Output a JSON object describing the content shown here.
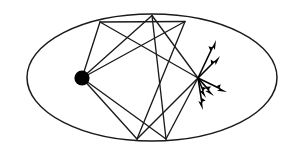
{
  "figure": {
    "title": "Elliptical billiard ray trajectory diagram",
    "caption": "",
    "background_color": "#ffffff",
    "stroke_color": "#1a1a1a",
    "node_color": "#000000",
    "arrow_color": "#000000",
    "width": 294,
    "height": 150
  },
  "chart_data": {
    "type": "scatter",
    "title": "",
    "xlabel": "",
    "ylabel": "",
    "grid": false,
    "legend_position": "none",
    "xlim": [
      0,
      294
    ],
    "ylim": [
      0,
      150
    ],
    "boundary": {
      "shape": "ellipse",
      "center": [
        152,
        77.5
      ],
      "radius_x": 125,
      "radius_y": 63.5,
      "stroke_width": 1.5
    },
    "nodes": [
      {
        "name": "source-point",
        "label": "",
        "x": 82,
        "y": 78,
        "radius": 7.6,
        "filled": true
      },
      {
        "name": "convergence-point",
        "label": "",
        "x": 198,
        "y": 78,
        "radius": 0,
        "filled": false
      }
    ],
    "reflection_points": [
      {
        "name": "vertex-top-left",
        "x": 100,
        "y": 22
      },
      {
        "name": "vertex-top-mid",
        "x": 152,
        "y": 15.5
      },
      {
        "name": "vertex-top-right",
        "x": 185,
        "y": 21.5
      },
      {
        "name": "vertex-bottom-left",
        "x": 137,
        "y": 139
      },
      {
        "name": "vertex-bottom-right",
        "x": 166,
        "y": 139
      }
    ],
    "ray_segments": [
      {
        "name": "ray-source-to-top-left",
        "from": [
          82,
          78
        ],
        "to": [
          100,
          22
        ]
      },
      {
        "name": "ray-top-left-to-top-right",
        "from": [
          100,
          22
        ],
        "to": [
          185,
          21.5
        ]
      },
      {
        "name": "ray-source-to-top-mid",
        "from": [
          82,
          78
        ],
        "to": [
          152,
          15.5
        ]
      },
      {
        "name": "ray-top-mid-to-convergence",
        "from": [
          152,
          15.5
        ],
        "to": [
          198,
          78
        ]
      },
      {
        "name": "ray-source-to-top-right-upper",
        "from": [
          82,
          78
        ],
        "to": [
          185,
          21.5
        ]
      },
      {
        "name": "ray-top-right-to-bottom-left",
        "from": [
          185,
          21.5
        ],
        "to": [
          137,
          139
        ]
      },
      {
        "name": "ray-convergence-to-top-left",
        "from": [
          198,
          78
        ],
        "to": [
          100,
          22
        ]
      },
      {
        "name": "ray-source-to-bottom-left",
        "from": [
          82,
          78
        ],
        "to": [
          137,
          139
        ]
      },
      {
        "name": "ray-source-to-bottom-right",
        "from": [
          82,
          78
        ],
        "to": [
          166,
          139
        ]
      },
      {
        "name": "ray-bottom-right-to-top-mid",
        "from": [
          166,
          139
        ],
        "to": [
          152,
          15.5
        ]
      },
      {
        "name": "ray-bottom-left-to-convergence",
        "from": [
          137,
          139
        ],
        "to": [
          198,
          78
        ]
      },
      {
        "name": "ray-bottom-right-to-convergence",
        "from": [
          166,
          139
        ],
        "to": [
          198,
          78
        ]
      }
    ],
    "arrows": {
      "origin": [
        198,
        78
      ],
      "count": 6,
      "vectors": [
        {
          "name": "arrow-up-steep",
          "to": [
            216,
            40
          ],
          "angle_deg": 64.7,
          "length": 42
        },
        {
          "name": "arrow-up-shallow",
          "to": [
            220,
            56
          ],
          "angle_deg": 45.0,
          "length": 31
        },
        {
          "name": "arrow-right-down-shallow",
          "to": [
            227,
            92
          ],
          "angle_deg": -25.7,
          "length": 32
        },
        {
          "name": "arrow-right-down-mid",
          "to": [
            214,
            96
          ],
          "angle_deg": -48.4,
          "length": 24
        },
        {
          "name": "arrow-down-steep",
          "to": [
            203,
            110
          ],
          "angle_deg": -81.1,
          "length": 32
        },
        {
          "name": "arrow-down-left-inner",
          "to": [
            206,
            98
          ],
          "angle_deg": -68.2,
          "length": 21
        }
      ]
    }
  }
}
